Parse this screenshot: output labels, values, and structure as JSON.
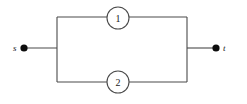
{
  "figure": {
    "type": "parallel-two-terminal-network",
    "background_color": "#ffffff",
    "line_color": "#4a4a4a",
    "dot_color": "#0d0d0d",
    "text_color": "#1a1a1a",
    "width": 247,
    "height": 104
  },
  "terminals": [
    {
      "id": "source",
      "label": "s",
      "dot": {
        "cx": 24,
        "cy": 48,
        "r": 3.6
      },
      "label_pos": {
        "x": 13,
        "y": 51
      }
    },
    {
      "id": "sink",
      "label": "t",
      "dot": {
        "cx": 216,
        "cy": 48,
        "r": 3.6
      },
      "label_pos": {
        "x": 223,
        "y": 51
      }
    }
  ],
  "edges": [
    {
      "id": "edge-1",
      "label": "1",
      "branch": "top",
      "circle": {
        "cx": 118,
        "cy": 18,
        "r": 11
      },
      "label_pos": {
        "x": 118,
        "y": 22
      }
    },
    {
      "id": "edge-2",
      "label": "2",
      "branch": "bottom",
      "circle": {
        "cx": 118,
        "cy": 82,
        "r": 11
      },
      "label_pos": {
        "x": 118,
        "y": 86
      }
    }
  ],
  "wires": {
    "source_lead": "M24,48 L57,48",
    "sink_lead": "M187,48 L216,48",
    "left_rail": "M57,17 L57,82",
    "right_rail": "M187,17 L187,82",
    "top_left_segment": "M57,17 L107,17",
    "top_right_segment": "M129,17 L187,17",
    "bottom_left_segment": "M57,82 L107,82",
    "bottom_right_segment": "M129,82 L187,82"
  }
}
